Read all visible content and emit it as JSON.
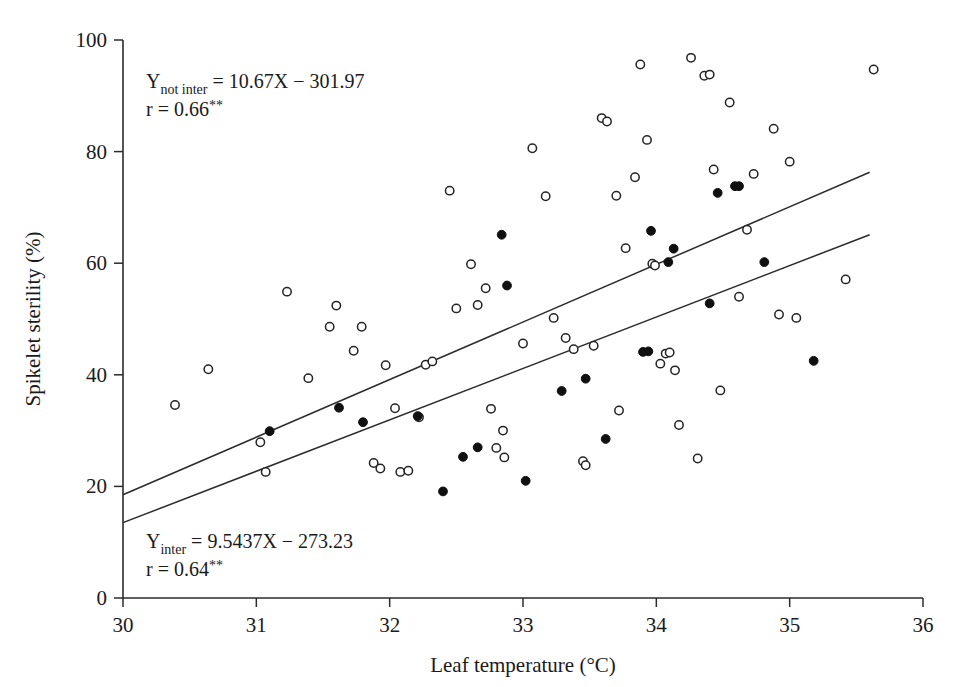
{
  "chart_data": {
    "type": "scatter",
    "title": "",
    "xlabel": "Leaf temperature (°C)",
    "ylabel": "Spikelet sterility (%)",
    "xlim": [
      30,
      36
    ],
    "ylim": [
      0,
      100
    ],
    "xticks": [
      30,
      31,
      32,
      33,
      34,
      35,
      36
    ],
    "yticks": [
      0,
      20,
      40,
      60,
      80,
      100
    ],
    "xtick_labels": [
      "30",
      "31",
      "32",
      "33",
      "34",
      "35",
      "36"
    ],
    "ytick_labels": [
      "0",
      "20",
      "40",
      "60",
      "80",
      "100"
    ],
    "grid": false,
    "legend": "none",
    "series": [
      {
        "name": "not intercepted (open circles)",
        "marker": "open-circle",
        "points": [
          [
            30.39,
            34.6
          ],
          [
            30.64,
            41.0
          ],
          [
            31.03,
            27.9
          ],
          [
            31.07,
            22.6
          ],
          [
            31.23,
            54.9
          ],
          [
            31.39,
            39.4
          ],
          [
            31.55,
            48.6
          ],
          [
            31.6,
            52.4
          ],
          [
            31.73,
            44.3
          ],
          [
            31.79,
            48.6
          ],
          [
            31.88,
            24.2
          ],
          [
            31.93,
            23.2
          ],
          [
            31.97,
            41.7
          ],
          [
            32.04,
            34.0
          ],
          [
            32.08,
            22.6
          ],
          [
            32.14,
            22.8
          ],
          [
            32.22,
            32.4
          ],
          [
            32.27,
            41.8
          ],
          [
            32.32,
            42.4
          ],
          [
            32.45,
            73.0
          ],
          [
            32.5,
            51.9
          ],
          [
            32.61,
            59.8
          ],
          [
            32.66,
            52.5
          ],
          [
            32.72,
            55.5
          ],
          [
            32.76,
            33.9
          ],
          [
            32.8,
            26.9
          ],
          [
            32.85,
            30.0
          ],
          [
            32.86,
            25.2
          ],
          [
            33.0,
            45.6
          ],
          [
            33.07,
            80.6
          ],
          [
            33.17,
            72.0
          ],
          [
            33.23,
            50.2
          ],
          [
            33.32,
            46.6
          ],
          [
            33.38,
            44.6
          ],
          [
            33.45,
            24.5
          ],
          [
            33.47,
            23.8
          ],
          [
            33.53,
            45.2
          ],
          [
            33.59,
            86.0
          ],
          [
            33.63,
            85.4
          ],
          [
            33.7,
            72.1
          ],
          [
            33.72,
            33.6
          ],
          [
            33.77,
            62.7
          ],
          [
            33.84,
            75.4
          ],
          [
            33.88,
            95.6
          ],
          [
            33.93,
            82.1
          ],
          [
            33.97,
            59.9
          ],
          [
            33.99,
            59.6
          ],
          [
            34.03,
            42.0
          ],
          [
            34.07,
            43.8
          ],
          [
            34.1,
            44.0
          ],
          [
            34.14,
            40.8
          ],
          [
            34.17,
            31.0
          ],
          [
            34.26,
            96.8
          ],
          [
            34.31,
            25.0
          ],
          [
            34.36,
            93.6
          ],
          [
            34.4,
            93.8
          ],
          [
            34.43,
            76.8
          ],
          [
            34.48,
            37.2
          ],
          [
            34.55,
            88.8
          ],
          [
            34.62,
            54.0
          ],
          [
            34.68,
            66.0
          ],
          [
            34.73,
            76.0
          ],
          [
            34.88,
            84.1
          ],
          [
            34.92,
            50.8
          ],
          [
            35.0,
            78.2
          ],
          [
            35.05,
            50.2
          ],
          [
            35.42,
            57.1
          ],
          [
            35.63,
            94.7
          ]
        ]
      },
      {
        "name": "intercepted (filled circles)",
        "marker": "filled-circle",
        "points": [
          [
            31.1,
            29.9
          ],
          [
            31.62,
            34.1
          ],
          [
            31.8,
            31.5
          ],
          [
            32.21,
            32.6
          ],
          [
            32.4,
            19.1
          ],
          [
            32.55,
            25.3
          ],
          [
            32.66,
            27.0
          ],
          [
            32.84,
            65.1
          ],
          [
            32.88,
            56.0
          ],
          [
            33.02,
            21.0
          ],
          [
            33.29,
            37.1
          ],
          [
            33.47,
            39.3
          ],
          [
            33.62,
            28.5
          ],
          [
            33.9,
            44.1
          ],
          [
            33.94,
            44.2
          ],
          [
            33.96,
            65.8
          ],
          [
            34.09,
            60.2
          ],
          [
            34.13,
            62.6
          ],
          [
            34.4,
            52.8
          ],
          [
            34.46,
            72.6
          ],
          [
            34.59,
            73.8
          ],
          [
            34.62,
            73.8
          ],
          [
            34.81,
            60.2
          ],
          [
            35.18,
            42.5
          ]
        ]
      }
    ],
    "fit_lines": [
      {
        "name": "not intercepted",
        "equation_var": "Y",
        "equation_sub": "not inter",
        "equation_rest": " = 10.67X − 301.97",
        "r_label": "r = 0.66",
        "r_sig": "**",
        "slope": 10.67,
        "intercept": -301.97,
        "x_start": 30.0,
        "y_start": 18.5,
        "x_end": 35.6,
        "y_end": 76.3
      },
      {
        "name": "intercepted",
        "equation_var": "Y",
        "equation_sub": "inter",
        "equation_rest": " = 9.5437X − 273.23",
        "r_label": "r = 0.64",
        "r_sig": "**",
        "slope": 9.5437,
        "intercept": -273.23,
        "x_start": 30.0,
        "y_start": 13.5,
        "x_end": 35.6,
        "y_end": 65.1
      }
    ]
  },
  "annotations": {
    "top": {
      "var": "Y",
      "sub": "not inter",
      "rest": " = 10.67X − 301.97",
      "r_text": "r = 0.66",
      "r_sig": "**"
    },
    "bottom": {
      "var": "Y",
      "sub": "inter",
      "rest": " = 9.5437X − 273.23",
      "r_text": "r = 0.64",
      "r_sig": "**"
    }
  },
  "colors": {
    "axis": "#2b2b2b",
    "marker_stroke": "#232323",
    "marker_fill_open": "#ffffff",
    "marker_fill_solid": "#101010",
    "background": "#ffffff"
  }
}
